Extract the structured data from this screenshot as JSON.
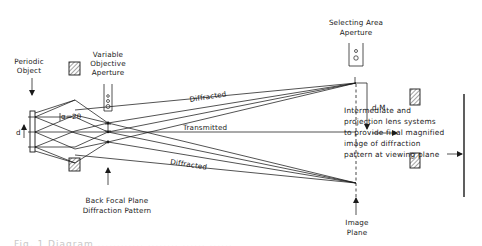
{
  "diagram": {
    "labels": {
      "periodic_object": [
        "Periodic",
        "Object"
      ],
      "variable_objective_aperture": [
        "Variable",
        "Objective",
        "Aperture"
      ],
      "selecting_area_aperture": [
        "Selecting Area",
        "Aperture"
      ],
      "diffracted_top": "Diffracted",
      "transmitted": "Transmitted",
      "diffracted_bottom": "Diffracted",
      "d": "d",
      "dM": "d.M",
      "alpha": "α=2θ",
      "back_focal_plane": [
        "Back Focal Plane",
        "Diffraction Pattern"
      ],
      "image_plane": [
        "Image",
        "Plane"
      ],
      "description": [
        "Intermediate and",
        "projection  lens  systems",
        "to provide final magnified",
        "image of diffraction",
        "pattern at viewing plane"
      ]
    },
    "caption_partial": "Fig. 1  Diagram ............ ........ ...... ......"
  }
}
